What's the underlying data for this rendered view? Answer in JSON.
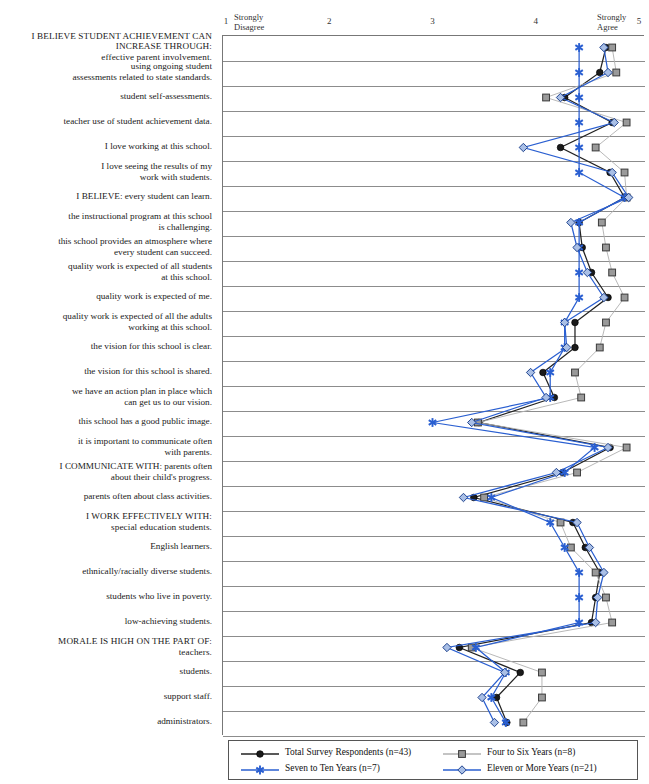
{
  "chart_data": {
    "type": "line",
    "orientation": "horizontal-categories",
    "title": "",
    "xlabel": "",
    "ylabel": "",
    "xlim": [
      1,
      5
    ],
    "grid": true,
    "legend_position": "bottom",
    "axis": {
      "ticks": [
        1,
        2,
        3,
        4,
        5
      ],
      "tick_labels": [
        "1",
        "2",
        "3",
        "4",
        "5"
      ],
      "low_anchor": "Strongly\nDisagree",
      "high_anchor": "Strongly\nAgree"
    },
    "categories": [
      "I BELIEVE STUDENT ACHIEVEMENT CAN\nINCREASE THROUGH:\neffective parent involvement.",
      "using ongoing student\nassessments related to state standards.",
      "student self-assessments.",
      "teacher use of student achievement data.",
      "I love working at this school.",
      "I love seeing the results of my\nwork with students.",
      "I BELIEVE: every student can learn.",
      "the instructional program at this school\nis challenging.",
      "this school provides an atmosphere where\nevery student can succeed.",
      "quality work is expected of all students\nat this school.",
      "quality work is expected of me.",
      "quality work is expected of all the adults\nworking at this school.",
      "the vision for this school is clear.",
      "the vision for this school is shared.",
      "we have an action plan in place which\ncan get us to our vision.",
      "this school has a good public image.",
      "it is important to communicate often\nwith parents.",
      "I COMMUNICATE WITH: parents often\nabout their child's progress.",
      "parents often about class activities.",
      "I WORK EFFECTIVELY WITH:\nspecial education students.",
      "English learners.",
      "ethnically/racially diverse students.",
      "students who live in poverty.",
      "low-achieving students.",
      "MORALE IS HIGH ON THE PART OF:\nteachers.",
      "students.",
      "support staff.",
      "administrators."
    ],
    "series": [
      {
        "name": "Total Survey Respondents (n=43)",
        "n": 43,
        "color": "#1a1a1a",
        "marker": "circle",
        "values": [
          4.68,
          4.62,
          4.28,
          4.74,
          4.24,
          4.72,
          4.86,
          4.42,
          4.45,
          4.54,
          4.7,
          4.38,
          4.38,
          4.07,
          4.18,
          3.45,
          4.72,
          4.26,
          3.4,
          4.36,
          4.48,
          4.62,
          4.58,
          4.54,
          3.26,
          3.85,
          3.62,
          3.72
        ]
      },
      {
        "name": "Four to Six Years (n=8)",
        "n": 8,
        "color": "#9a9a9a",
        "marker": "square",
        "values": [
          4.74,
          4.78,
          4.1,
          4.88,
          4.58,
          4.86,
          4.88,
          4.64,
          4.68,
          4.74,
          4.86,
          4.68,
          4.62,
          4.38,
          4.44,
          3.44,
          4.88,
          4.4,
          3.5,
          4.24,
          4.34,
          4.58,
          4.68,
          4.74,
          3.38,
          4.06,
          4.06,
          3.88
        ]
      },
      {
        "name": "Seven to Ten Years (n=7)",
        "n": 7,
        "color": "#2a5fd1",
        "marker": "asterisk",
        "values": [
          4.42,
          4.42,
          4.42,
          4.42,
          4.42,
          4.42,
          4.86,
          4.42,
          4.42,
          4.42,
          4.42,
          4.28,
          4.28,
          4.14,
          4.14,
          3.0,
          4.57,
          4.28,
          3.57,
          4.14,
          4.28,
          4.42,
          4.42,
          4.42,
          3.42,
          3.71,
          3.57,
          3.71
        ]
      },
      {
        "name": "Eleven or More Years (n=21)",
        "n": 21,
        "color": "#2a5fd1",
        "marker": "diamond",
        "values": [
          4.66,
          4.7,
          4.24,
          4.76,
          3.88,
          4.74,
          4.9,
          4.34,
          4.4,
          4.5,
          4.66,
          4.28,
          4.3,
          3.95,
          4.1,
          3.38,
          4.7,
          4.2,
          3.3,
          4.4,
          4.52,
          4.66,
          4.6,
          4.58,
          3.14,
          3.7,
          3.48,
          3.6
        ]
      }
    ]
  },
  "legend": {
    "items": [
      {
        "label": "Total Survey Respondents (n=43)",
        "marker": "circle",
        "color": "#1a1a1a"
      },
      {
        "label": "Four to Six Years (n=8)",
        "marker": "square",
        "color": "#9a9a9a"
      },
      {
        "label": "Seven to Ten Years (n=7)",
        "marker": "asterisk",
        "color": "#2a5fd1"
      },
      {
        "label": "Eleven or More Years (n=21)",
        "marker": "diamond",
        "color": "#2a5fd1"
      }
    ]
  }
}
